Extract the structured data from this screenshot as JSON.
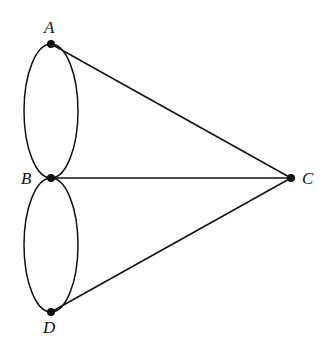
{
  "diagram": {
    "type": "graph",
    "vertices": [
      {
        "id": "A",
        "label": "A",
        "x": 51,
        "y": 44
      },
      {
        "id": "B",
        "label": "B",
        "x": 51,
        "y": 178
      },
      {
        "id": "C",
        "label": "C",
        "x": 291,
        "y": 178
      },
      {
        "id": "D",
        "label": "D",
        "x": 51,
        "y": 312
      }
    ],
    "edges": [
      {
        "from": "A",
        "to": "B",
        "kind": "curve-left"
      },
      {
        "from": "A",
        "to": "B",
        "kind": "curve-right"
      },
      {
        "from": "B",
        "to": "D",
        "kind": "curve-left"
      },
      {
        "from": "B",
        "to": "D",
        "kind": "curve-right"
      },
      {
        "from": "A",
        "to": "C",
        "kind": "straight"
      },
      {
        "from": "B",
        "to": "C",
        "kind": "straight"
      },
      {
        "from": "D",
        "to": "C",
        "kind": "straight"
      }
    ]
  }
}
